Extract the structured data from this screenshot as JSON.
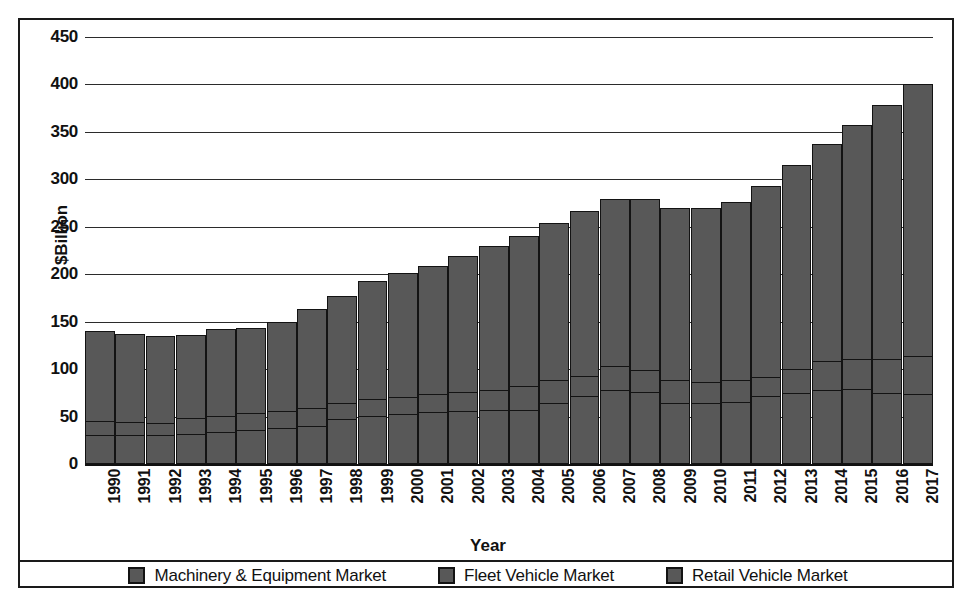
{
  "figure": {
    "ylabel": "$Billion",
    "xlabel": "Year",
    "bar_color": "#585858",
    "border_color": "#131313",
    "grid_color": "#2b2b2b"
  },
  "legend": {
    "items": [
      {
        "label": "Machinery & Equipment Market",
        "swatch": "#585858"
      },
      {
        "label": "Fleet Vehicle Market",
        "swatch": "#585858"
      },
      {
        "label": "Retail Vehicle Market",
        "swatch": "#585858"
      }
    ]
  },
  "chart_data": {
    "type": "bar",
    "subtype": "stacked-vertical",
    "title": "",
    "subtitle": "",
    "xlabel": "Year",
    "ylabel": "$Billion",
    "ylim": [
      0,
      450
    ],
    "yticks": [
      0,
      50,
      100,
      150,
      200,
      250,
      300,
      350,
      400,
      450
    ],
    "ytick_labels": [
      "0",
      "50",
      "100",
      "150",
      "200",
      "250",
      "300",
      "350",
      "400",
      "450"
    ],
    "grid": "horizontal",
    "legend_position": "bottom",
    "categories": [
      "1990",
      "1991",
      "1992",
      "1993",
      "1994",
      "1995",
      "1996",
      "1997",
      "1998",
      "1999",
      "2000",
      "2001",
      "2002",
      "2003",
      "2004",
      "2005",
      "2006",
      "2007",
      "2008",
      "2009",
      "2010",
      "2011",
      "2012",
      "2013",
      "2014",
      "2015",
      "2016",
      "2017"
    ],
    "series": [
      {
        "name": "Retail Vehicle Market",
        "stack_order": 0,
        "values": [
          30,
          29,
          29,
          31,
          33,
          35,
          37,
          39,
          46,
          50,
          52,
          54,
          55,
          56,
          56,
          63,
          71,
          77,
          75,
          63,
          63,
          64,
          71,
          74,
          77,
          78,
          74,
          73
        ]
      },
      {
        "name": "Fleet Vehicle Market",
        "stack_order": 1,
        "values": [
          14,
          14,
          13,
          16,
          17,
          18,
          18,
          19,
          17,
          17,
          18,
          19,
          20,
          21,
          25,
          25,
          21,
          25,
          23,
          25,
          22,
          23,
          20,
          25,
          30,
          32,
          36,
          40
        ]
      },
      {
        "name": "Machinery & Equipment Market",
        "stack_order": 2,
        "values": [
          94,
          92,
          91,
          87,
          90,
          89,
          93,
          104,
          112,
          124,
          129,
          134,
          142,
          151,
          158,
          164,
          173,
          176,
          180,
          180,
          183,
          187,
          200,
          214,
          228,
          246,
          267,
          286
        ]
      }
    ],
    "totals": [
      138,
      135,
      133,
      134,
      140,
      142,
      148,
      162,
      175,
      191,
      199,
      207,
      217,
      228,
      239,
      252,
      265,
      278,
      278,
      268,
      268,
      274,
      291,
      313,
      335,
      356,
      377,
      399
    ]
  }
}
